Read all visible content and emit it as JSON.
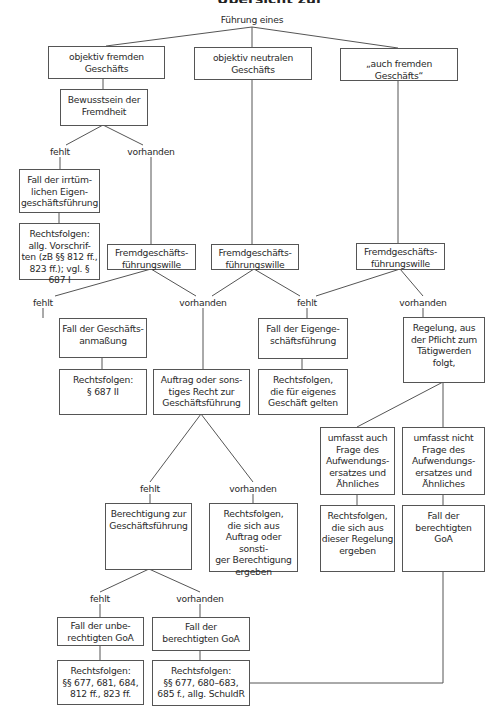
{
  "title": {
    "text": "Übersicht zur Geschäftsführung ohne Auftrag: Fallgestaltungen",
    "visible": "partially cut off at top"
  },
  "root": "Führung eines",
  "level1": [
    {
      "text": "objektiv fremden\nGeschäfts"
    },
    {
      "text": "objektiv neutralen\nGeschäfts"
    },
    {
      "text": "„auch fremden Geschäfts“"
    }
  ],
  "bewusstsein": "Bewusstsein der\nFremdheit",
  "labels": {
    "fehlt": "fehlt",
    "vorhanden": "vorhanden"
  },
  "irrtuemlich": "Fall der irrtüm-\nlichen Eigen-\ngeschäftsführung",
  "rf_allg": "Rechtsfolgen:\nallg. Vorschrif-\nten (zB §§ 812 ff.,\n823 ff.); vgl. § 687 I",
  "willen": [
    "Fremdgeschäfts-\nführungswille",
    "Fremdgeschäfts-\nführungswille",
    "Fremdgeschäfts-\nführungswille"
  ],
  "anmassung": "Fall der Geschäfts-\nanmaßung",
  "rf_687": "Rechtsfolgen:\n§ 687 II",
  "auftrag": "Auftrag oder sons-\ntiges Recht zur\nGeschäftsführung",
  "eigen": "Fall der Eigenge-\nschäftsführung",
  "rf_eigen": "Rechtsfolgen,\ndie für eigenes\nGeschäft gelten",
  "regelung": "Regelung, aus\nder Pflicht zum\nTätigwerden\nfolgt,",
  "umfasst_auch": "umfasst auch\nFrage des\nAufwendungs-\nersatzes und\nÄhnliches",
  "umfasst_nicht": "umfasst nicht\nFrage des\nAufwendungs-\nersatzes und\nÄhnliches",
  "rf_regelung": "Rechtsfolgen,\ndie sich aus\ndieser Regelung\nergeben",
  "fall_berechtigt_r": "Fall der\nberechtigten\nGoA",
  "berechtigung": "Berechtigung zur\nGeschäftsführung",
  "rf_auftrag": "Rechtsfolgen,\ndie sich aus\nAuftrag oder sonsti-\nger Berechtigung\nergeben",
  "unberechtigt": "Fall der unbe-\nrechtigten GoA",
  "berechtigt": "Fall der\nberechtigten GoA",
  "rf_unber": "Rechtsfolgen:\n§§ 677, 681, 684,\n812 ff., 823 ff.",
  "rf_ber": "Rechtsfolgen:\n§§ 677, 680–683,\n685 f., allg. SchuldR",
  "colors": {
    "line": "#555555",
    "text": "#2a2a2a",
    "background": "#ffffff"
  }
}
